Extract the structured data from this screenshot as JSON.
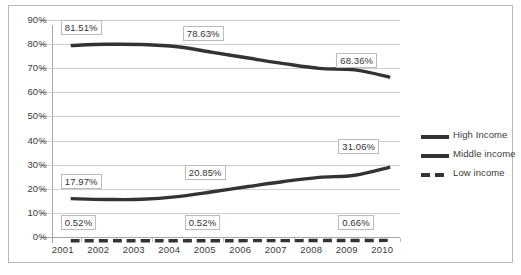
{
  "chart_data": {
    "type": "line",
    "title": "",
    "xlabel": "",
    "ylabel": "",
    "categories": [
      "2001",
      "2002",
      "2003",
      "2004",
      "2005",
      "2006",
      "2007",
      "2008",
      "2009",
      "2010"
    ],
    "ylim": [
      0,
      90
    ],
    "ytick_labels": [
      "0%",
      "10%",
      "20%",
      "30%",
      "40%",
      "50%",
      "60%",
      "70%",
      "80%",
      "90%"
    ],
    "ytick_values": [
      0,
      10,
      20,
      30,
      40,
      50,
      60,
      70,
      80,
      90
    ],
    "grid": true,
    "legend_position": "right",
    "series": [
      {
        "name": "High Income",
        "style": "solid",
        "color": "#333333",
        "values": [
          81.51,
          82.0,
          81.9,
          81.0,
          78.63,
          76.3,
          74.0,
          72.0,
          71.4,
          68.36
        ],
        "labels": [
          {
            "category": "2001",
            "value": 81.51,
            "text": "81.51%"
          },
          {
            "category": "2005",
            "value": 78.63,
            "text": "78.63%"
          },
          {
            "category": "2010",
            "value": 68.36,
            "text": "68.36%"
          }
        ]
      },
      {
        "name": "Middle income",
        "style": "solid",
        "color": "#333333",
        "values": [
          17.97,
          17.65,
          17.7,
          18.8,
          20.85,
          23.0,
          25.1,
          26.8,
          27.7,
          31.06
        ],
        "labels": [
          {
            "category": "2001",
            "value": 17.97,
            "text": "17.97%"
          },
          {
            "category": "2005",
            "value": 20.85,
            "text": "20.85%"
          },
          {
            "category": "2010",
            "value": 31.06,
            "text": "31.06%"
          }
        ]
      },
      {
        "name": "Low income",
        "style": "dashed",
        "color": "#333333",
        "values": [
          0.52,
          0.52,
          0.52,
          0.52,
          0.52,
          0.55,
          0.58,
          0.6,
          0.62,
          0.66
        ],
        "labels": [
          {
            "category": "2001",
            "value": 0.52,
            "text": "0.52%"
          },
          {
            "category": "2005",
            "value": 0.52,
            "text": "0.52%"
          },
          {
            "category": "2010",
            "value": 0.66,
            "text": "0.66%"
          }
        ]
      }
    ]
  },
  "legend": {
    "items": [
      {
        "label": "High Income"
      },
      {
        "label": "Middle income"
      },
      {
        "label": "Low income"
      }
    ]
  }
}
